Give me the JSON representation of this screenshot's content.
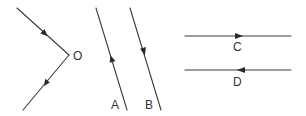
{
  "figure": {
    "colors": {
      "line": "#3a3a3a",
      "arrow": "#2a2a2a",
      "label": "#333333",
      "background": "#ffffff"
    },
    "groups": [
      {
        "id": "O",
        "label": "O",
        "type": "converging-rays",
        "rays": [
          {
            "from": [
              17,
              8
            ],
            "to": [
              69,
              55
            ],
            "arrow_direction": "toward-O"
          },
          {
            "from": [
              69,
              55
            ],
            "to": [
              23,
              110
            ],
            "arrow_direction": "away-from-O"
          }
        ]
      },
      {
        "id": "A",
        "label": "A",
        "type": "slanted-line",
        "from": [
          96,
          8
        ],
        "to": [
          127,
          110
        ],
        "arrow_direction": "up"
      },
      {
        "id": "B",
        "label": "B",
        "type": "slanted-line",
        "from": [
          130,
          8
        ],
        "to": [
          161,
          110
        ],
        "arrow_direction": "down"
      },
      {
        "id": "C",
        "label": "C",
        "type": "horizontal-line",
        "from": [
          185,
          36
        ],
        "to": [
          291,
          36
        ],
        "arrow_direction": "right"
      },
      {
        "id": "D",
        "label": "D",
        "type": "horizontal-line",
        "from": [
          185,
          70
        ],
        "to": [
          291,
          70
        ],
        "arrow_direction": "left"
      }
    ]
  }
}
